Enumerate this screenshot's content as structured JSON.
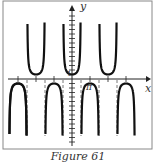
{
  "caption": "Figure 61",
  "chart_data": {
    "type": "line",
    "title": "",
    "function": "y = sec(2x)",
    "xlabel": "x",
    "ylabel": "y",
    "tick_labels": {
      "x": [
        "π"
      ],
      "y": [
        "1"
      ]
    },
    "asymptotes_x": [
      "-5π/4",
      "-3π/4",
      "-π/4",
      "π/4",
      "3π/4",
      "5π/4"
    ],
    "local_minima": [
      {
        "x": "-π",
        "y": 1
      },
      {
        "x": "0",
        "y": 1
      },
      {
        "x": "π",
        "y": 1
      }
    ],
    "local_maxima": [
      {
        "x": "-π/2",
        "y": -1
      },
      {
        "x": "π/2",
        "y": -1
      }
    ],
    "grid": false,
    "frame": true
  }
}
